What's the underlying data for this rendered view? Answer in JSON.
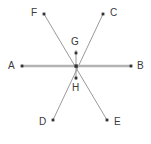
{
  "figure": {
    "canvas": {
      "width": 151,
      "height": 144
    },
    "background_color": "#ffffff",
    "label_color": "#3a3a3a",
    "point_color": "#333333",
    "line_color": "#9a9a9a",
    "axis_line_color": "#b3b3b3",
    "vertices": {
      "A": {
        "label": "A",
        "x": 22,
        "y": 66,
        "label_x": 8,
        "label_y": 61
      },
      "B": {
        "label": "B",
        "x": 131,
        "y": 66,
        "label_x": 137,
        "label_y": 61
      },
      "C": {
        "label": "C",
        "x": 103,
        "y": 14,
        "label_x": 110,
        "label_y": 8
      },
      "D": {
        "label": "D",
        "x": 53,
        "y": 120,
        "label_x": 39,
        "label_y": 117
      },
      "E": {
        "label": "E",
        "x": 107,
        "y": 120,
        "label_x": 114,
        "label_y": 117
      },
      "F": {
        "label": "F",
        "x": 44,
        "y": 14,
        "label_x": 31,
        "label_y": 8
      },
      "G": {
        "label": "G",
        "x": 76,
        "y": 53,
        "label_x": 71,
        "label_y": 37
      },
      "H": {
        "label": "H",
        "x": 76,
        "y": 78,
        "label_x": 72,
        "label_y": 83
      }
    },
    "intersection": {
      "x": 76,
      "y": 66
    },
    "segments": [
      {
        "name": "segment-a-b",
        "from": "A",
        "to": "B",
        "style": "thick"
      },
      {
        "name": "segment-f-e",
        "from": "F",
        "to": "E",
        "style": "thin"
      },
      {
        "name": "segment-c-d",
        "from": "C",
        "to": "D",
        "style": "thin"
      },
      {
        "name": "segment-g-h",
        "from": "G",
        "to": "H",
        "style": "thin"
      }
    ],
    "point_radius": 1.8
  }
}
